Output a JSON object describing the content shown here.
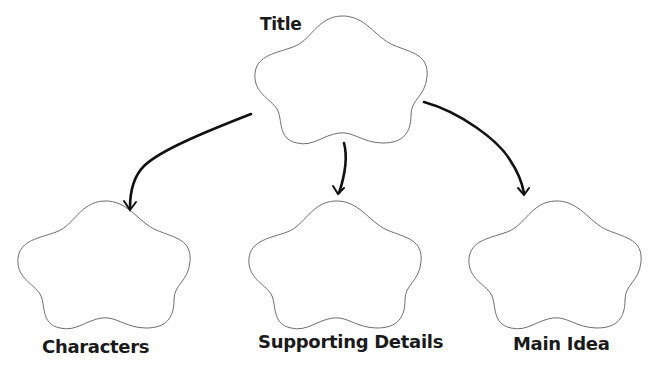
{
  "diagram": {
    "type": "hierarchy graphic organizer",
    "colors": {
      "background": "#ffffff",
      "cloud_outline": "#6e6e6e",
      "arrow": "#111111",
      "text": "#1a1a1a"
    },
    "root": {
      "label": "Title",
      "shape": "cloud"
    },
    "children": [
      {
        "label": "Characters",
        "shape": "cloud"
      },
      {
        "label": "Supporting Details",
        "shape": "cloud"
      },
      {
        "label": "Main Idea",
        "shape": "cloud"
      }
    ],
    "edges": [
      {
        "from": "Title",
        "to": "Characters"
      },
      {
        "from": "Title",
        "to": "Supporting Details"
      },
      {
        "from": "Title",
        "to": "Main Idea"
      }
    ]
  }
}
